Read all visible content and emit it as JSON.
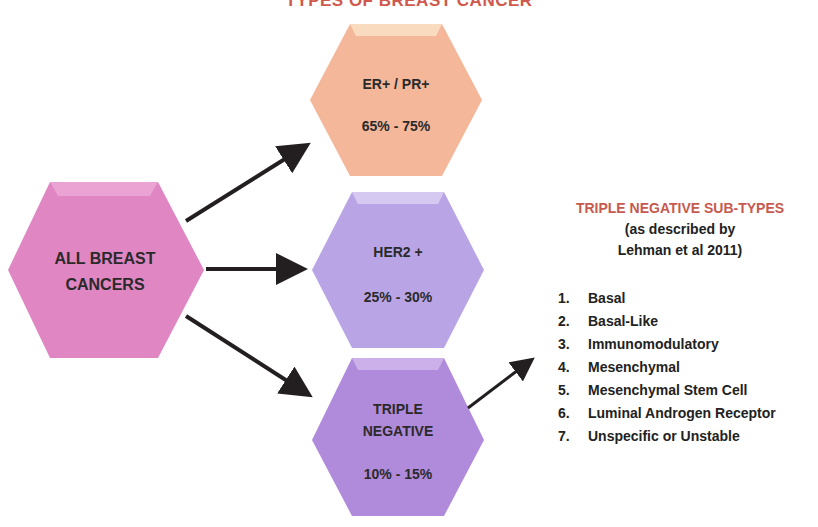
{
  "title": "TYPES OF BREAST CANCER",
  "colors": {
    "root": "#df86c3",
    "er_pr": "#f4b79a",
    "her2": "#b9a5e6",
    "triple": "#b18bdb",
    "title_accent": "#d0584c",
    "arrow": "#231f20"
  },
  "nodes": {
    "root": {
      "label_line1": "ALL BREAST",
      "label_line2": "CANCERS"
    },
    "er_pr": {
      "label": "ER+  /  PR+",
      "range": "65% - 75%"
    },
    "her2": {
      "label": "HER2 +",
      "range": "25% - 30%"
    },
    "triple": {
      "label_line1": "TRIPLE",
      "label_line2": "NEGATIVE",
      "range": "10% - 15%"
    }
  },
  "subtypes": {
    "heading": "TRIPLE NEGATIVE SUB-TYPES",
    "source_line1": "(as described by",
    "source_line2": "Lehman et al 2011)",
    "items": [
      {
        "num": "1.",
        "label": "Basal"
      },
      {
        "num": "2.",
        "label": "Basal-Like"
      },
      {
        "num": "3.",
        "label": "Immunomodulatory"
      },
      {
        "num": "4.",
        "label": "Mesenchymal"
      },
      {
        "num": "5.",
        "label": "Mesenchymal Stem Cell"
      },
      {
        "num": "6.",
        "label": "Luminal Androgen Receptor"
      },
      {
        "num": "7.",
        "label": "Unspecific or Unstable"
      }
    ]
  }
}
